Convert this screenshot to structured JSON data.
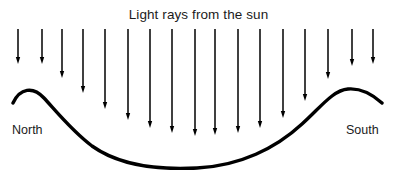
{
  "diagram": {
    "kind": "science-illustration",
    "width": 397,
    "height": 170,
    "background_color": "#ffffff",
    "ink_color": "#000000",
    "text_color": "#1b1b1b",
    "title": "Light rays from the sun",
    "labels": {
      "left": "North",
      "right": "South"
    },
    "ground": {
      "description": "curved earth surface: north hill, central basin, south hill",
      "stroke_width": 3.4,
      "path": "M 13,103 C 20,88 33,86 44,98 C 56,111 72,131 92,146 C 120,166 160,170 197,168 C 240,166 276,148 302,124 C 320,108 333,90 348,89 C 360,88 372,94 382,103"
    },
    "rays": {
      "color": "#000000",
      "stroke_width": 1.5,
      "head_width": 4.4,
      "head_length": 7,
      "top_y": 29,
      "arrows": [
        {
          "x": 18,
          "y2": 64
        },
        {
          "x": 42,
          "y2": 64
        },
        {
          "x": 62,
          "y2": 78
        },
        {
          "x": 83,
          "y2": 93
        },
        {
          "x": 105,
          "y2": 109
        },
        {
          "x": 128,
          "y2": 120
        },
        {
          "x": 150,
          "y2": 128
        },
        {
          "x": 172,
          "y2": 133
        },
        {
          "x": 195,
          "y2": 136
        },
        {
          "x": 215,
          "y2": 135
        },
        {
          "x": 238,
          "y2": 133
        },
        {
          "x": 260,
          "y2": 128
        },
        {
          "x": 283,
          "y2": 118
        },
        {
          "x": 305,
          "y2": 101
        },
        {
          "x": 328,
          "y2": 79
        },
        {
          "x": 352,
          "y2": 66
        },
        {
          "x": 373,
          "y2": 64
        }
      ]
    }
  }
}
